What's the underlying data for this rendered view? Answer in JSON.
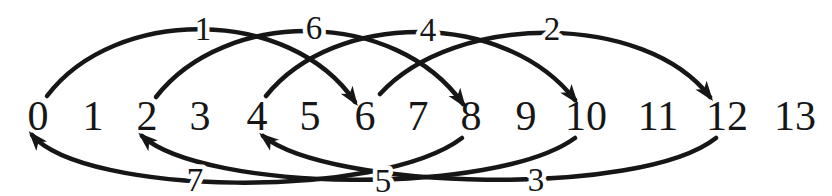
{
  "diagram": {
    "canvas": {
      "width": 832,
      "height": 196
    },
    "background": "#ffffff",
    "ink_color": "#161616",
    "node_row": {
      "values": [
        "0",
        "1",
        "2",
        "3",
        "4",
        "5",
        "6",
        "7",
        "8",
        "9",
        "10",
        "11",
        "12",
        "13"
      ],
      "x_positions": [
        38,
        93,
        147,
        200,
        257,
        310,
        365,
        418,
        471,
        526,
        586,
        658,
        727,
        795
      ],
      "baseline_y": 130,
      "font_size": 42
    },
    "arc_style": {
      "stroke_width": 4.5,
      "label_font_size": 33,
      "label_baseline_offset": 11
    },
    "arcs": [
      {
        "step_label": "1",
        "from": "0",
        "to": "6",
        "side": "top",
        "start": [
          47,
          96
        ],
        "control1": [
          115,
          6
        ],
        "control2": [
          290,
          6
        ],
        "end": [
          355,
          102
        ],
        "label_xy": [
          203,
          29
        ]
      },
      {
        "step_label": "6",
        "from": "2",
        "to": "8",
        "side": "top",
        "start": [
          156,
          97
        ],
        "control1": [
          225,
          8
        ],
        "control2": [
          395,
          8
        ],
        "end": [
          463,
          104
        ],
        "label_xy": [
          314,
          28
        ]
      },
      {
        "step_label": "4",
        "from": "4",
        "to": "10",
        "side": "top",
        "start": [
          266,
          96
        ],
        "control1": [
          335,
          10
        ],
        "control2": [
          505,
          10
        ],
        "end": [
          575,
          100
        ],
        "label_xy": [
          428,
          30
        ]
      },
      {
        "step_label": "2",
        "from": "6",
        "to": "12",
        "side": "top",
        "start": [
          380,
          94
        ],
        "control1": [
          455,
          12
        ],
        "control2": [
          645,
          12
        ],
        "end": [
          710,
          97
        ],
        "label_xy": [
          552,
          29
        ]
      },
      {
        "step_label": "7",
        "from": "8",
        "to": "0",
        "side": "bottom",
        "start": [
          462,
          138
        ],
        "control1": [
          380,
          200
        ],
        "control2": [
          85,
          196
        ],
        "end": [
          32,
          135
        ],
        "label_xy": [
          195,
          180
        ]
      },
      {
        "step_label": "5",
        "from": "10",
        "to": "2",
        "side": "bottom",
        "start": [
          575,
          138
        ],
        "control1": [
          495,
          196
        ],
        "control2": [
          205,
          192
        ],
        "end": [
          142,
          136
        ],
        "label_xy": [
          383,
          181
        ]
      },
      {
        "step_label": "3",
        "from": "12",
        "to": "4",
        "side": "bottom",
        "start": [
          716,
          138
        ],
        "control1": [
          640,
          198
        ],
        "control2": [
          330,
          190
        ],
        "end": [
          263,
          136
        ],
        "label_xy": [
          536,
          180
        ]
      }
    ]
  }
}
